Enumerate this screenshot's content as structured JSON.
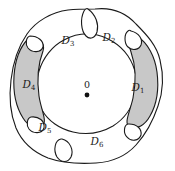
{
  "figure": {
    "background_color": "#ffffff",
    "stroke_color": "#1a1a1a",
    "shaded_fill_color": "#c8c8c8",
    "center": {
      "label": "0",
      "marker": "filled-dot"
    },
    "regions": [
      {
        "id": "D1",
        "letter": "D",
        "subscript": "1",
        "position": "right",
        "shaded": true
      },
      {
        "id": "D2",
        "letter": "D",
        "subscript": "2",
        "position": "top-right",
        "shaded": false
      },
      {
        "id": "D3",
        "letter": "D",
        "subscript": "3",
        "position": "top-left",
        "shaded": false
      },
      {
        "id": "D4",
        "letter": "D",
        "subscript": "4",
        "position": "left",
        "shaded": true
      },
      {
        "id": "D5",
        "letter": "D",
        "subscript": "5",
        "position": "bottom-left",
        "shaded": false
      },
      {
        "id": "D6",
        "letter": "D",
        "subscript": "6",
        "position": "bottom",
        "shaded": false
      }
    ]
  }
}
